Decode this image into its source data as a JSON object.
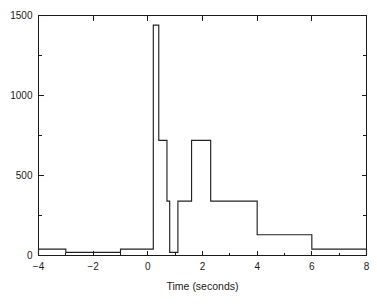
{
  "chart_data": {
    "type": "line",
    "subtype": "step-histogram",
    "title": "",
    "xlabel": "Time (seconds)",
    "ylabel": "",
    "xlim": [
      -4,
      8
    ],
    "ylim": [
      0,
      1500
    ],
    "grid": false,
    "legend": null,
    "x_ticks": [
      -4,
      -2,
      0,
      2,
      4,
      6,
      8
    ],
    "x_tick_labels": [
      "−4",
      "−2",
      "0",
      "2",
      "4",
      "6",
      "8"
    ],
    "x_minor_ticks": [
      -3,
      -1,
      1,
      3,
      5,
      7
    ],
    "y_ticks": [
      0,
      500,
      1000,
      1500
    ],
    "y_tick_labels": [
      "0",
      "500",
      "1000",
      "1500"
    ],
    "y_minor_ticks": [
      250,
      750,
      1250
    ],
    "bin_edges": [
      -4,
      -3,
      -1,
      0,
      0.2,
      0.4,
      0.7,
      0.8,
      1.0,
      1.1,
      1.6,
      2.3,
      4.0,
      6.0,
      8.0
    ],
    "values": [
      40,
      20,
      40,
      40,
      1440,
      720,
      340,
      20,
      20,
      340,
      720,
      340,
      130,
      40
    ],
    "series": [
      {
        "name": "counts",
        "values": [
          40,
          20,
          40,
          40,
          1440,
          720,
          340,
          20,
          20,
          340,
          720,
          340,
          130,
          40
        ]
      }
    ],
    "annotations": [],
    "colors": {
      "line": "#222222",
      "axis": "#1a1a1a",
      "background": "#ffffff"
    }
  }
}
